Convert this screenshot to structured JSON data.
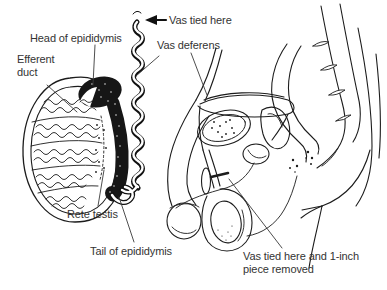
{
  "colors": {
    "background": "#ffffff",
    "line": "#1c1c1c",
    "dark_fill": "#161616",
    "text": "#333333"
  },
  "icons": {
    "vas_tied_pointer": "left-arrow"
  },
  "labels": {
    "vas_tied_top": "Vas tied here",
    "vas_deferens": "Vas deferens",
    "head_epididymis": "Head of epididymis",
    "efferent_duct": "Efferent duct",
    "rete_testis": "Rete testis",
    "tail_epididymis": "Tail of epididymis",
    "vas_tied_removed": "Vas tied here and 1-inch piece removed"
  }
}
